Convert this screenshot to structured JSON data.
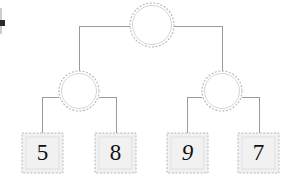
{
  "diagram": {
    "type": "binary-tree",
    "background_color": "#ffffff",
    "line_color": "#9a9a9a",
    "circle_stroke_color": "#b5b5b5",
    "circle_fill_color": "#ffffff",
    "leaf_fill_color": "#f1f1f1",
    "leaf_stroke_color": "#b9b9b9",
    "text_color": "#111111"
  },
  "nodes": {
    "root": {
      "id": "root",
      "label": "",
      "shape": "circle",
      "cx": 152,
      "cy": 25,
      "r": 22
    },
    "internal_left": {
      "id": "internal-left",
      "label": "",
      "shape": "circle",
      "cx": 79,
      "cy": 91,
      "r": 20
    },
    "internal_right": {
      "id": "internal-right",
      "label": "",
      "shape": "circle",
      "cx": 222,
      "cy": 91,
      "r": 20
    }
  },
  "leaves": [
    {
      "id": "leaf-1",
      "value": "5",
      "shape": "square",
      "x": 22,
      "y": 133,
      "w": 41,
      "h": 40,
      "slanted": false
    },
    {
      "id": "leaf-2",
      "value": "8",
      "shape": "square",
      "x": 95,
      "y": 133,
      "w": 41,
      "h": 40,
      "slanted": false
    },
    {
      "id": "leaf-3",
      "value": "9",
      "shape": "square",
      "x": 167,
      "y": 133,
      "w": 41,
      "h": 40,
      "slanted": true
    },
    {
      "id": "leaf-4",
      "value": "7",
      "shape": "square",
      "x": 238,
      "y": 133,
      "w": 41,
      "h": 40,
      "slanted": false
    }
  ],
  "edges": [
    {
      "id": "edge-root-left",
      "from": "root",
      "to": "internal-left",
      "path": "M 130 26 L 79 26 L 79 71"
    },
    {
      "id": "edge-root-right",
      "from": "root",
      "to": "internal-right",
      "path": "M 174 26 L 222 26 L 222 71"
    },
    {
      "id": "edge-left-leaf1",
      "from": "internal-left",
      "to": "leaf-1",
      "path": "M 59 97 L 42 97 L 42 133"
    },
    {
      "id": "edge-left-leaf2",
      "from": "internal-left",
      "to": "leaf-2",
      "path": "M 99 97 L 116 97 L 116 133"
    },
    {
      "id": "edge-right-leaf3",
      "from": "internal-right",
      "to": "leaf-3",
      "path": "M 202 97 L 187 97 L 187 133"
    },
    {
      "id": "edge-right-leaf4",
      "from": "internal-right",
      "to": "leaf-4",
      "path": "M 242 97 L 259 97 L 259 133"
    }
  ],
  "artifacts": {
    "left_edge_mark": {
      "id": "left-edge-mark",
      "x": 0,
      "y": 20,
      "w": 5,
      "h": 6
    }
  }
}
